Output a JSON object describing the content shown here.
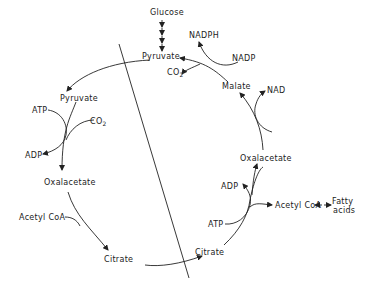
{
  "diagram": {
    "type": "metabolic-pathway",
    "colors": {
      "line": "#222222",
      "background": "#ffffff"
    },
    "labels": {
      "glucose": "Glucose",
      "pyruvate_right": "Pyruvate",
      "nadph": "NADPH",
      "nadp": "NADP",
      "co2_right": "CO",
      "co2_right_sub": "2",
      "malate": "Malate",
      "nad": "NAD",
      "oxalacetate_right": "Oxalacetate",
      "adp_right": "ADP",
      "acetyl_coa_right": "Acetyl CoA",
      "fatty_acids_line1": "Fatty",
      "fatty_acids_line2": "acids",
      "atp_right": "ATP",
      "citrate_right": "Citrate",
      "pyruvate_left": "Pyruvate",
      "atp_left": "ATP",
      "co2_left": "CO",
      "co2_left_sub": "2",
      "adp_left": "ADP",
      "oxalacetate_left": "Oxalacetate",
      "acetyl_coa_left": "Acetyl CoA",
      "citrate_left": "Citrate"
    },
    "nodes": [
      "Glucose",
      "Pyruvate",
      "NADPH",
      "NADP",
      "CO2",
      "Malate",
      "NAD",
      "Oxalacetate",
      "ADP",
      "Acetyl CoA",
      "Fatty acids",
      "ATP",
      "Citrate"
    ],
    "edges": [
      {
        "from": "Glucose",
        "to": "Pyruvate",
        "style": "multi-step"
      },
      {
        "from": "Pyruvate",
        "to": "Pyruvate (left)",
        "side": "crosses membrane"
      },
      {
        "from": "Pyruvate (left)",
        "to": "Oxalacetate (left)",
        "cofactors": [
          "ATP->ADP",
          "CO2"
        ]
      },
      {
        "from": "Oxalacetate (left)",
        "to": "Citrate (left)",
        "cofactors": [
          "Acetyl CoA"
        ]
      },
      {
        "from": "Citrate (left)",
        "to": "Citrate (right)",
        "side": "crosses membrane"
      },
      {
        "from": "Citrate (right)",
        "to": "Oxalacetate (right)",
        "cofactors": [
          "ATP->ADP",
          "Acetyl CoA out"
        ]
      },
      {
        "from": "Acetyl CoA",
        "to": "Fatty acids"
      },
      {
        "from": "Oxalacetate (right)",
        "to": "Malate",
        "cofactors": [
          "NADH->NAD"
        ]
      },
      {
        "from": "Malate",
        "to": "Pyruvate",
        "cofactors": [
          "NADP->NADPH",
          "CO2 out"
        ]
      }
    ]
  }
}
